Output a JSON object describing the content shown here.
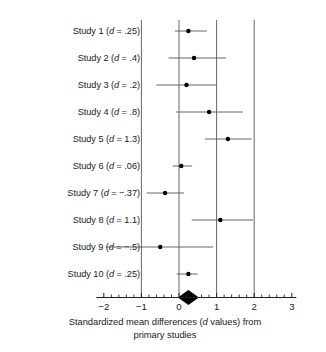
{
  "chart_data": {
    "type": "scatter",
    "subtype": "forest-plot",
    "title": "",
    "xlabel_line1": "Standardized mean differences (d values) from",
    "xlabel_line2": "primary studies",
    "xlabel_italic_token": "d",
    "ylabel": "",
    "xlim": [
      -2.2,
      3.15
    ],
    "xticks": [
      -2,
      -1,
      0,
      1,
      2,
      3
    ],
    "xtick_labels": [
      "−2",
      "−1",
      "0",
      "1",
      "2",
      "3"
    ],
    "minor_tick_step": 0.2,
    "grid": false,
    "reference_lines": [
      -1,
      0,
      1,
      2
    ],
    "legend": "none",
    "categories": [
      "Study 1 (d = .25)",
      "Study 2 (d = .4)",
      "Study 3 (d = .2)",
      "Study 4 (d = .8)",
      "Study 5 (d = 1.3)",
      "Study 6 (d = .06)",
      "Study 7 (d = −.37)",
      "Study 8 (d = 1.1)",
      "Study 9 (d = −.5)",
      "Study 10 (d = .25)"
    ],
    "studies": [
      {
        "name": "Study 1",
        "label_prefix": "Study 1 (",
        "label_italic": "d",
        "label_suffix": " = .25)",
        "d": 0.25,
        "ci_low": -0.11,
        "ci_high": 0.74
      },
      {
        "name": "Study 2",
        "label_prefix": "Study 2 (",
        "label_italic": "d",
        "label_suffix": " = .4)",
        "d": 0.4,
        "ci_low": -0.28,
        "ci_high": 1.25
      },
      {
        "name": "Study 3",
        "label_prefix": "Study 3 (",
        "label_italic": "d",
        "label_suffix": " = .2)",
        "d": 0.2,
        "ci_low": -0.6,
        "ci_high": 1.0
      },
      {
        "name": "Study 4",
        "label_prefix": "Study 4 (",
        "label_italic": "d",
        "label_suffix": " = .8)",
        "d": 0.8,
        "ci_low": -0.08,
        "ci_high": 1.7
      },
      {
        "name": "Study 5",
        "label_prefix": "Study 5 (",
        "label_italic": "d",
        "label_suffix": " = 1.3)",
        "d": 1.3,
        "ci_low": 0.69,
        "ci_high": 1.93
      },
      {
        "name": "Study 6",
        "label_prefix": "Study 6 (",
        "label_italic": "d",
        "label_suffix": " = .06)",
        "d": 0.06,
        "ci_low": -0.17,
        "ci_high": 0.35
      },
      {
        "name": "Study 7",
        "label_prefix": "Study 7 (",
        "label_italic": "d",
        "label_suffix": " = −.37)",
        "d": -0.37,
        "ci_low": -0.86,
        "ci_high": 0.13
      },
      {
        "name": "Study 8",
        "label_prefix": "Study 8 (",
        "label_italic": "d",
        "label_suffix": " = 1.1)",
        "d": 1.1,
        "ci_low": 0.34,
        "ci_high": 1.97
      },
      {
        "name": "Study 9",
        "label_prefix": "Study 9 (",
        "label_italic": "d",
        "label_suffix": " = −.5)",
        "d": -0.5,
        "ci_low": -1.95,
        "ci_high": 0.91
      },
      {
        "name": "Study 10",
        "label_prefix": "Study 10 (",
        "label_italic": "d",
        "label_suffix": " = .25)",
        "d": 0.25,
        "ci_low": -0.06,
        "ci_high": 0.5
      }
    ],
    "summary_diamond": {
      "center": 0.25,
      "low": -0.03,
      "high": 0.53,
      "color": "#000000"
    }
  },
  "style": {
    "line_color": "#555555",
    "marker_color": "#000000",
    "axis_color": "#222222",
    "background": "#ffffff"
  }
}
